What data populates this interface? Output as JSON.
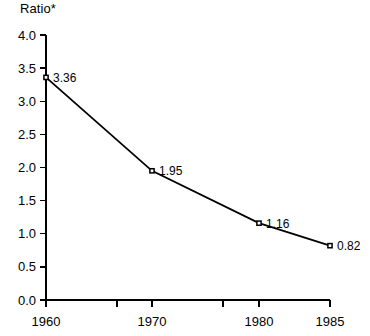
{
  "chart_data": {
    "type": "line",
    "title": "",
    "ylabel": "Ratio*",
    "xlabel": "",
    "x": [
      1960,
      1970,
      1980,
      1985
    ],
    "categories": [
      "1960",
      "1970",
      "1980",
      "1985"
    ],
    "values": [
      3.36,
      1.95,
      1.16,
      0.82
    ],
    "point_labels": [
      "3.36",
      "1.95",
      "1.16",
      "0.82"
    ],
    "series": [
      {
        "name": "Ratio",
        "values": [
          3.36,
          1.95,
          1.16,
          0.82
        ],
        "marker": "open-square",
        "color": "#000000"
      }
    ],
    "ylim": [
      0.0,
      4.0
    ],
    "ytick_labels": [
      "0.0",
      "0.5",
      "1.0",
      "1.5",
      "2.0",
      "2.5",
      "3.0",
      "3.5",
      "4.0"
    ],
    "ytick_values": [
      0.0,
      0.5,
      1.0,
      1.5,
      2.0,
      2.5,
      3.0,
      3.5,
      4.0
    ],
    "xtick_labels": [
      "1960",
      "1970",
      "1980",
      "1985"
    ],
    "xtick_values": [
      1960,
      1970,
      1980,
      1985
    ],
    "x_minor_tick_values": [
      1965,
      1975
    ],
    "grid": false,
    "legend": "none",
    "background": "#ffffff",
    "line_color": "#000000"
  }
}
